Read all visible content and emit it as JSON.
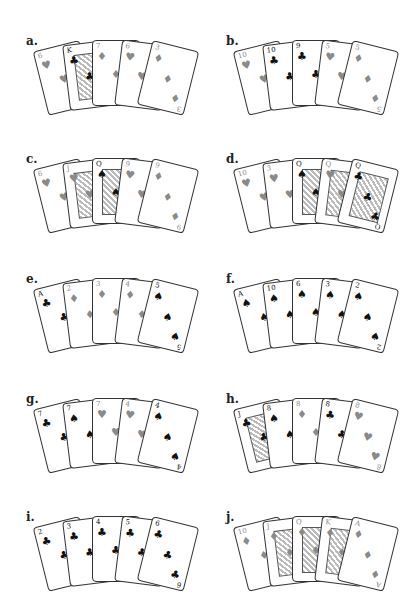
{
  "figure": {
    "panels": [
      {
        "label": "a.",
        "hand": "One Pair",
        "cards": [
          {
            "rank": "6",
            "suit": "♥"
          },
          {
            "rank": "K",
            "suit": "♣"
          },
          {
            "rank": "7",
            "suit": "♦"
          },
          {
            "rank": "6",
            "suit": "♥"
          },
          {
            "rank": "3",
            "suit": "♦"
          }
        ]
      },
      {
        "label": "b.",
        "hand": "Two Pair",
        "cards": [
          {
            "rank": "10",
            "suit": "♥"
          },
          {
            "rank": "10",
            "suit": "♣"
          },
          {
            "rank": "9",
            "suit": "♣"
          },
          {
            "rank": "5",
            "suit": "♥"
          },
          {
            "rank": "5",
            "suit": "♦"
          }
        ]
      },
      {
        "label": "c.",
        "hand": "One Pair",
        "cards": [
          {
            "rank": "6",
            "suit": "♥"
          },
          {
            "rank": "J",
            "suit": "♥"
          },
          {
            "rank": "Q",
            "suit": "♠"
          },
          {
            "rank": "9",
            "suit": "♥"
          },
          {
            "rank": "9",
            "suit": "♦"
          }
        ]
      },
      {
        "label": "d.",
        "hand": "Three of a Kind",
        "cards": [
          {
            "rank": "10",
            "suit": "♥"
          },
          {
            "rank": "3",
            "suit": "♥"
          },
          {
            "rank": "Q",
            "suit": "♠"
          },
          {
            "rank": "Q",
            "suit": "♥"
          },
          {
            "rank": "Q",
            "suit": "♣"
          }
        ]
      },
      {
        "label": "e.",
        "hand": "Straight",
        "cards": [
          {
            "rank": "A",
            "suit": "♣"
          },
          {
            "rank": "2",
            "suit": "♦"
          },
          {
            "rank": "3",
            "suit": "♦"
          },
          {
            "rank": "4",
            "suit": "♦"
          },
          {
            "rank": "5",
            "suit": "♠"
          }
        ]
      },
      {
        "label": "f.",
        "hand": "Flush",
        "cards": [
          {
            "rank": "A",
            "suit": "♠"
          },
          {
            "rank": "10",
            "suit": "♠"
          },
          {
            "rank": "6",
            "suit": "♠"
          },
          {
            "rank": "3",
            "suit": "♠"
          },
          {
            "rank": "2",
            "suit": "♠"
          }
        ]
      },
      {
        "label": "g.",
        "hand": "Full House",
        "cards": [
          {
            "rank": "7",
            "suit": "♣"
          },
          {
            "rank": "7",
            "suit": "♠"
          },
          {
            "rank": "7",
            "suit": "♥"
          },
          {
            "rank": "4",
            "suit": "♥"
          },
          {
            "rank": "4",
            "suit": "♠"
          }
        ]
      },
      {
        "label": "h.",
        "hand": "Four of a Kind",
        "cards": [
          {
            "rank": "J",
            "suit": "♣"
          },
          {
            "rank": "8",
            "suit": "♠"
          },
          {
            "rank": "8",
            "suit": "♦"
          },
          {
            "rank": "8",
            "suit": "♣"
          },
          {
            "rank": "8",
            "suit": "♥"
          }
        ]
      },
      {
        "label": "i.",
        "hand": "Straight Flush",
        "cards": [
          {
            "rank": "2",
            "suit": "♣"
          },
          {
            "rank": "3",
            "suit": "♣"
          },
          {
            "rank": "4",
            "suit": "♣"
          },
          {
            "rank": "5",
            "suit": "♣"
          },
          {
            "rank": "6",
            "suit": "♣"
          }
        ]
      },
      {
        "label": "j.",
        "hand": "Royal Flush",
        "cards": [
          {
            "rank": "10",
            "suit": "♦"
          },
          {
            "rank": "J",
            "suit": "♦"
          },
          {
            "rank": "Q",
            "suit": "♦"
          },
          {
            "rank": "K",
            "suit": "♦"
          },
          {
            "rank": "A",
            "suit": "♦"
          }
        ]
      }
    ]
  },
  "colors": {
    "red_suit": "#8a8a8a",
    "black_suit": "#111111",
    "card_border": "#333333",
    "background": "#ffffff"
  }
}
